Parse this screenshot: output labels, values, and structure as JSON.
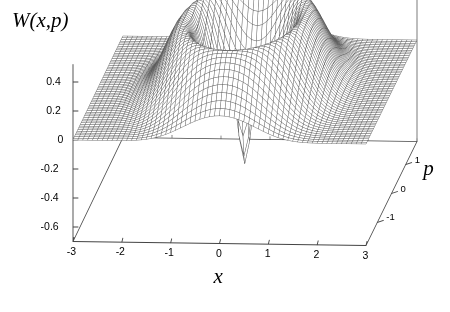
{
  "figure": {
    "title": "W(x,p)",
    "kind": "3d-surface-mesh-plot"
  },
  "axes": {
    "x": {
      "title": "x",
      "ticks": [
        "-3",
        "-2",
        "-1",
        "0",
        "1",
        "2",
        "3"
      ],
      "range": [
        -3,
        3
      ]
    },
    "p": {
      "title": "p",
      "ticks": [
        "-1",
        "0",
        "1"
      ],
      "range": [
        -1.8,
        1.8
      ]
    },
    "z": {
      "ticks": [
        "0.4",
        "0.2",
        "0",
        "-0.2",
        "-0.4",
        "-0.6"
      ],
      "range": [
        -0.7,
        0.5
      ]
    }
  },
  "style": {
    "line_color": "#555555",
    "axis_color": "#444444",
    "background": "#ffffff"
  },
  "chart_data": {
    "type": "surface",
    "title": "W(x,p)",
    "xlabel": "x",
    "ylabel": "p",
    "zlabel": "W(x,p)",
    "xlim": [
      -3,
      3
    ],
    "ylim": [
      -1.8,
      1.8
    ],
    "zlim": [
      -0.7,
      0.5
    ],
    "grid": false,
    "legend": false,
    "mesh": {
      "nx": 61,
      "np": 61
    },
    "features": [
      {
        "name": "outer-plane",
        "z": 0.0
      },
      {
        "name": "positive-ring-crest",
        "radius": 1.15,
        "z": 0.45
      },
      {
        "name": "inner-trough",
        "radius": 0.62,
        "z": 0.08
      },
      {
        "name": "central-column-top",
        "radius": 0.0,
        "z": 0.42
      },
      {
        "name": "negative-spike",
        "radius": 0.0,
        "z": -0.5
      }
    ],
    "z_ticks": [
      0.4,
      0.2,
      0,
      -0.2,
      -0.4,
      -0.6
    ],
    "x_ticks": [
      -3,
      -2,
      -1,
      0,
      1,
      2,
      3
    ],
    "p_ticks": [
      -1,
      0,
      1
    ]
  }
}
